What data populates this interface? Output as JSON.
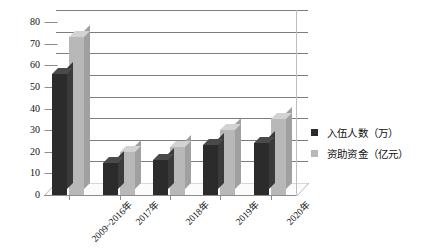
{
  "chart_data": {
    "type": "bar",
    "title": "",
    "subtitle": "",
    "xlabel": "",
    "ylabel": "",
    "categories": [
      "2009~2016年",
      "2017年",
      "2018年",
      "2019年",
      "2020年"
    ],
    "series": [
      {
        "name": "入伍人数（万）",
        "values": [
          56,
          15,
          16,
          23,
          24
        ],
        "color": "#2b2b2b"
      },
      {
        "name": "资助资金（亿元）",
        "values": [
          73,
          20,
          22,
          30,
          35
        ],
        "color": "#b8b8b8"
      }
    ],
    "ylim": [
      0,
      80
    ],
    "ytick_labels": [
      "0",
      "10",
      "20",
      "30",
      "40",
      "50",
      "60",
      "70",
      "80"
    ],
    "ytick_values": [
      0,
      10,
      20,
      30,
      40,
      50,
      60,
      70,
      80
    ],
    "grid": true,
    "grid_axis": "y",
    "legend_position": "right",
    "style": "3d-clustered-column"
  },
  "legend": {
    "items": [
      {
        "label": "入伍人数（万）"
      },
      {
        "label": "资助资金（亿元）"
      }
    ]
  }
}
